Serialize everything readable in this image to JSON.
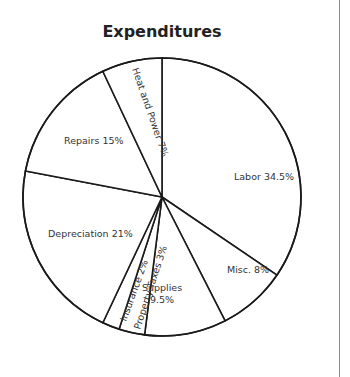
{
  "chart_data": {
    "type": "pie",
    "title": "Expenditures",
    "start_angle_deg": 0,
    "direction": "clockwise",
    "slices": [
      {
        "label": "Labor",
        "value": 34.5,
        "text": "Labor 34.5%"
      },
      {
        "label": "Misc.",
        "value": 8,
        "text": "Misc. 8%"
      },
      {
        "label": "Supplies",
        "value": 9.5,
        "text": "Supplies 9.5%"
      },
      {
        "label": "Property Taxes",
        "value": 3,
        "text": "Property Taxes 3%"
      },
      {
        "label": "Insurance",
        "value": 2,
        "text": "Insurance 2%"
      },
      {
        "label": "Depreciation",
        "value": 21,
        "text": "Depreciation 21%"
      },
      {
        "label": "Repairs",
        "value": 15,
        "text": "Repairs 15%"
      },
      {
        "label": "Heat and Power",
        "value": 7,
        "text": "Heat and Power 7%"
      }
    ],
    "categories": [
      "Labor",
      "Misc.",
      "Supplies",
      "Property Taxes",
      "Insurance",
      "Depreciation",
      "Repairs",
      "Heat and Power"
    ],
    "values": [
      34.5,
      8,
      9.5,
      3,
      2,
      21,
      15,
      7
    ],
    "legend": "none (labels inside slices)",
    "colors": {
      "fill": "#ffffff",
      "stroke": "#1a1a1a"
    }
  },
  "labels": {
    "labor": "Labor 34.5%",
    "misc": "Misc. 8%",
    "supplies_1": "Supplies",
    "supplies_2": "9.5%",
    "property_taxes": "Property Taxes 3%",
    "insurance": "Insurance 2%",
    "depreciation": "Depreciation 21%",
    "repairs": "Repairs 15%",
    "heat_power": "Heat and Power 7%"
  }
}
